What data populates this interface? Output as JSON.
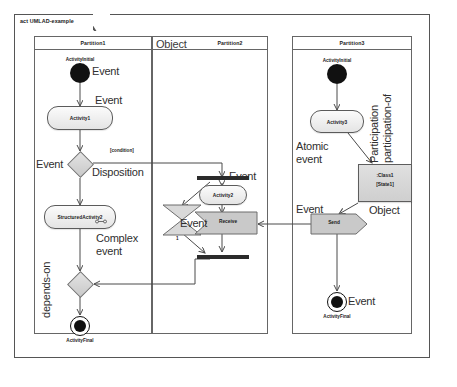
{
  "frame": {
    "tab_label": "act UMLAD-example"
  },
  "partitions": [
    {
      "id": "p1",
      "title": "Partition1"
    },
    {
      "id": "p2",
      "title": "Partition2",
      "caption": "Object"
    },
    {
      "id": "p3",
      "title": "Partition3"
    }
  ],
  "nodes": {
    "p1_initial": {
      "caption": "ActivityInitial"
    },
    "p1_activity1": {
      "label": "Activity1"
    },
    "p1_decision": {
      "guard": "[condition]"
    },
    "p1_structured": {
      "label": "StructuredActivity2",
      "icon": "sub-activity-rake-icon"
    },
    "p1_merge": {
      "label": ""
    },
    "p1_final": {
      "caption": "ActivityFinal"
    },
    "p2_fork": {
      "label": ""
    },
    "p2_activity2": {
      "label": "Activity2"
    },
    "p2_timeevent": {
      "counter": "1"
    },
    "p2_receive": {
      "label": "Receive"
    },
    "p2_join": {
      "label": ""
    },
    "p3_initial": {
      "caption": "ActivityInitial"
    },
    "p3_activity3": {
      "label": "Activity3"
    },
    "p3_class": {
      "line1": ":Class1",
      "line2": "[State1]"
    },
    "p3_send": {
      "label": "Send"
    },
    "p3_final": {
      "caption": "ActivityFinal"
    }
  },
  "annotations": {
    "event_initial_p1": "Event",
    "event_activity1": "Event",
    "event_decision": "Event",
    "disposition": "Disposition",
    "complex_event": "Complex",
    "complex_event2": "event",
    "depends_on": "depends-on",
    "event_fork": "Event",
    "event_timeevent": "Event",
    "atomic_event": "Atomic",
    "atomic_event2": "event",
    "participation": "Participation",
    "participation_of": "participation-of",
    "object_label": "Object",
    "event_send": "Event",
    "event_final_p3": "Event"
  },
  "colors": {
    "frame_stroke": "#555555",
    "node_stroke": "#5b5b5b",
    "node_fill": "#e8e8e8",
    "solid_black": "#111111",
    "connector": "#4a4a4a",
    "anno_text": "#2f2f2f"
  }
}
